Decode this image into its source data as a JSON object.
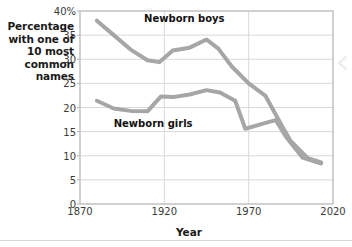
{
  "chart_data": {
    "type": "line",
    "title": "",
    "subtitle": "",
    "xlabel": "Year",
    "ylabel": "Percentage with one of 10 most common names",
    "ylabel_lines": [
      "Percentage",
      "with one of",
      "10 most",
      "common",
      "names"
    ],
    "xlim": [
      1870,
      2020
    ],
    "ylim": [
      0,
      40
    ],
    "xticks": [
      1870,
      1920,
      1970,
      2020
    ],
    "xticklabels": [
      "1870",
      "1920",
      "1970",
      "2020"
    ],
    "yticks": [
      0,
      5,
      10,
      15,
      20,
      25,
      30,
      35,
      40
    ],
    "yticklabels": [
      "0",
      "5",
      "10",
      "15",
      "20",
      "25",
      "30",
      "35",
      "40%"
    ],
    "grid": true,
    "grid_axis": "both",
    "legend_position": "inline-annotations",
    "series": [
      {
        "name": "Newborn boys",
        "color": "#a6a6a6",
        "label_x": 1908,
        "label_y": 38.4,
        "x": [
          1880,
          1890,
          1900,
          1910,
          1917,
          1925,
          1935,
          1945,
          1952,
          1960,
          1970,
          1980,
          1990,
          1995,
          2005,
          2013
        ],
        "y": [
          38.0,
          35.0,
          32.0,
          29.8,
          29.4,
          31.8,
          32.4,
          34.1,
          32.2,
          28.5,
          25.0,
          22.4,
          16.0,
          13.0,
          9.5,
          8.6
        ]
      },
      {
        "name": "Newborn girls",
        "color": "#a6a6a6",
        "label_x": 1890,
        "label_y": 16.6,
        "x": [
          1880,
          1890,
          1900,
          1910,
          1918,
          1926,
          1935,
          1945,
          1953,
          1962,
          1968,
          1978,
          1986,
          1992,
          2002,
          2013
        ],
        "y": [
          21.4,
          19.8,
          19.3,
          19.2,
          22.3,
          22.2,
          22.7,
          23.6,
          23.1,
          21.4,
          15.6,
          16.6,
          17.4,
          14.0,
          9.6,
          8.4
        ]
      }
    ],
    "style": {
      "line_width": 4,
      "plot_bg": "#ffffff",
      "grid_color": "#d9d9d9",
      "axis_color": "#b5b5b5",
      "text_color": "#1a1a1a"
    },
    "plot_box": {
      "left": 80,
      "top": 11,
      "right": 333,
      "bottom": 204
    }
  },
  "decor": {
    "edge_chevron": "chevron-left-icon"
  }
}
